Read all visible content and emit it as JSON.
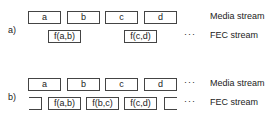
{
  "diagram": {
    "a": {
      "label": "a)",
      "media_stream": {
        "label": "Media stream",
        "packets": [
          "a",
          "b",
          "c",
          "d"
        ]
      },
      "fec_stream": {
        "label": "FEC stream",
        "packets": [
          "f(a,b)",
          "f(c,d)"
        ],
        "ellipsis": "···"
      }
    },
    "b": {
      "label": "b)",
      "media_stream": {
        "label": "Media stream",
        "packets": [
          "a",
          "b",
          "c",
          "d"
        ],
        "ellipsis": "···"
      },
      "fec_stream": {
        "label": "FEC stream",
        "packets": [
          "f(a,b)",
          "f(b,c)",
          "f(c,d)"
        ],
        "ellipsis": "···"
      }
    }
  }
}
